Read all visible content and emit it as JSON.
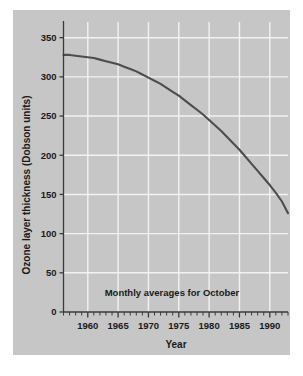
{
  "figure": {
    "background_color": "#ffffff",
    "panel_color": "#c6c6c6",
    "grid_color": "#f2f2f2",
    "axis_color": "#3a3a3a",
    "curve_color": "#4d4d4d"
  },
  "chart_data": {
    "type": "line",
    "title": "",
    "subtitle": "",
    "annotation": "Monthly averages for October",
    "xlabel": "Year",
    "ylabel": "Ozone layer thickness (Dobson units)",
    "xlim": [
      1956,
      1993
    ],
    "ylim": [
      0,
      370
    ],
    "yticks": [
      0,
      50,
      100,
      150,
      200,
      250,
      300,
      350
    ],
    "ytick_labels": [
      "0",
      "50",
      "100",
      "150",
      "200",
      "250",
      "300",
      "350"
    ],
    "xticks": [
      1960,
      1965,
      1970,
      1975,
      1980,
      1985,
      1990
    ],
    "xtick_labels": [
      "1960",
      "1965",
      "1970",
      "1975",
      "1980",
      "1985",
      "1990"
    ],
    "minor_xtick_interval": 1,
    "grid": true,
    "grid_axes": "both",
    "legend": "none",
    "series": [
      {
        "name": "Ozone layer thickness",
        "color": "#4d4d4d",
        "x": [
          1956,
          1957,
          1958,
          1959,
          1960,
          1961,
          1962,
          1963,
          1964,
          1965,
          1966,
          1967,
          1968,
          1969,
          1970,
          1971,
          1972,
          1973,
          1974,
          1975,
          1976,
          1977,
          1978,
          1979,
          1980,
          1981,
          1982,
          1983,
          1984,
          1985,
          1986,
          1987,
          1988,
          1989,
          1990,
          1991,
          1992,
          1993
        ],
        "values": [
          328,
          328,
          327,
          326,
          325,
          324,
          322,
          320,
          318,
          316,
          313,
          310,
          307,
          303,
          299,
          295,
          291,
          286,
          281,
          276,
          270,
          264,
          258,
          252,
          245,
          238,
          231,
          223,
          215,
          207,
          198,
          189,
          180,
          171,
          162,
          152,
          141,
          126
        ]
      }
    ]
  }
}
